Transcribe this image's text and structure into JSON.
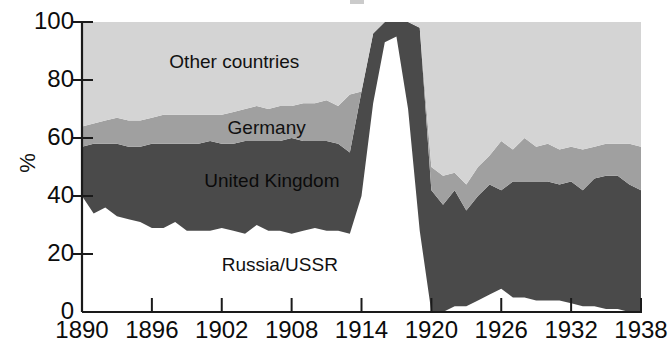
{
  "figure": {
    "axis_y_title": "%",
    "y_ticks": [
      0,
      20,
      40,
      60,
      80,
      100
    ],
    "x_ticks": [
      1890,
      1896,
      1902,
      1908,
      1914,
      1920,
      1926,
      1932,
      1938
    ],
    "series_labels": {
      "other": "Other countries",
      "germany": "Germany",
      "uk": "United Kingdom",
      "russia": "Russia/USSR"
    },
    "colors": {
      "other": "#d4d4d4",
      "germany": "#a0a0a0",
      "uk": "#4a4a4a",
      "russia": "#ffffff",
      "axis": "#1a1a1a",
      "text": "#0c0c0c",
      "background": "#ffffff"
    }
  },
  "chart_data": {
    "type": "area",
    "stacked": true,
    "title": "",
    "subtitle": "",
    "xlabel": "",
    "ylabel": "%",
    "xlim": [
      1890,
      1938
    ],
    "ylim": [
      0,
      100
    ],
    "grid": false,
    "legend": "inline-labels",
    "tick_labels_x": [
      "1890",
      "1896",
      "1902",
      "1908",
      "1914",
      "1920",
      "1926",
      "1932",
      "1938"
    ],
    "tick_labels_y": [
      "0",
      "20",
      "40",
      "60",
      "80",
      "100"
    ],
    "x": [
      1890,
      1891,
      1892,
      1893,
      1894,
      1895,
      1896,
      1897,
      1898,
      1899,
      1900,
      1901,
      1902,
      1903,
      1904,
      1905,
      1906,
      1907,
      1908,
      1909,
      1910,
      1911,
      1912,
      1913,
      1914,
      1915,
      1916,
      1917,
      1918,
      1919,
      1920,
      1921,
      1922,
      1923,
      1924,
      1925,
      1926,
      1927,
      1928,
      1929,
      1930,
      1931,
      1932,
      1933,
      1934,
      1935,
      1936,
      1937,
      1938
    ],
    "series": [
      {
        "name": "Russia/USSR",
        "color": "#ffffff",
        "values": [
          40,
          34,
          36,
          33,
          32,
          31,
          29,
          29,
          31,
          28,
          28,
          28,
          29,
          28,
          27,
          30,
          28,
          28,
          27,
          28,
          29,
          28,
          28,
          27,
          40,
          72,
          93,
          95,
          70,
          28,
          0,
          0,
          2,
          2,
          4,
          6,
          8,
          5,
          5,
          4,
          4,
          4,
          3,
          2,
          2,
          1,
          1,
          0,
          0
        ]
      },
      {
        "name": "United Kingdom",
        "color": "#4a4a4a",
        "values": [
          17,
          24,
          22,
          25,
          25,
          26,
          29,
          29,
          27,
          30,
          30,
          31,
          29,
          30,
          32,
          29,
          31,
          31,
          33,
          31,
          30,
          31,
          30,
          28,
          36,
          24,
          7,
          5,
          30,
          70,
          42,
          37,
          40,
          33,
          36,
          38,
          34,
          40,
          40,
          41,
          41,
          40,
          42,
          40,
          44,
          46,
          46,
          44,
          42
        ]
      },
      {
        "name": "Germany",
        "color": "#a0a0a0",
        "values": [
          7,
          7,
          8,
          9,
          9,
          9,
          9,
          10,
          10,
          10,
          10,
          9,
          10,
          11,
          11,
          12,
          11,
          12,
          11,
          13,
          13,
          14,
          13,
          20,
          0,
          0,
          0,
          0,
          0,
          0,
          8,
          10,
          6,
          9,
          10,
          10,
          17,
          11,
          15,
          12,
          13,
          12,
          12,
          14,
          11,
          11,
          11,
          14,
          15
        ]
      },
      {
        "name": "Other countries",
        "color": "#d4d4d4",
        "values": [
          36,
          35,
          34,
          33,
          34,
          34,
          33,
          32,
          32,
          32,
          32,
          32,
          32,
          31,
          30,
          29,
          30,
          29,
          29,
          28,
          28,
          27,
          29,
          25,
          24,
          4,
          0,
          0,
          0,
          2,
          50,
          53,
          52,
          56,
          50,
          46,
          41,
          44,
          40,
          43,
          42,
          44,
          43,
          44,
          43,
          42,
          42,
          42,
          43
        ]
      }
    ],
    "annotations": [
      {
        "text": "Other countries",
        "x": 1897.5,
        "y": 86
      },
      {
        "text": "Germany",
        "x": 1902.5,
        "y": 63
      },
      {
        "text": "United Kingdom",
        "x": 1900.5,
        "y": 45
      },
      {
        "text": "Russia/USSR",
        "x": 1902,
        "y": 16
      }
    ]
  }
}
